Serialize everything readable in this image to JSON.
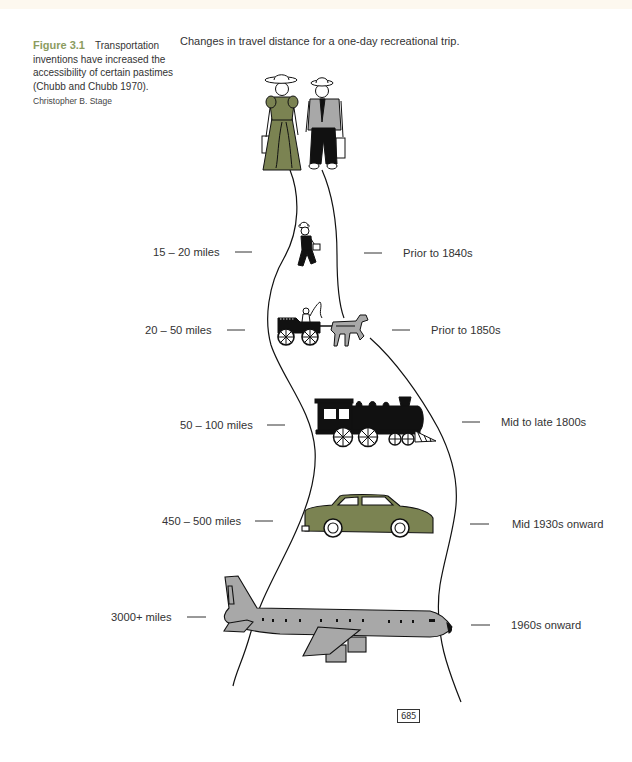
{
  "caption": {
    "figure_label": "Figure 3.1",
    "text_lines": [
      "Transportation",
      "inventions have increased the",
      "accessibility of certain pastimes",
      "(Chubb and Chubb 1970)."
    ],
    "credit": "Christopher B. Stage"
  },
  "title": "Changes in travel distance for a one-day recreational trip.",
  "stages": [
    {
      "mode_icon": "walker-icon",
      "distance": "15 – 20 miles",
      "period": "Prior to 1840s"
    },
    {
      "mode_icon": "horse-carriage-icon",
      "distance": "20 – 50 miles",
      "period": "Prior to 1850s"
    },
    {
      "mode_icon": "steam-train-icon",
      "distance": "50 – 100 miles",
      "period": "Mid to late 1800s"
    },
    {
      "mode_icon": "car-icon",
      "distance": "450 – 500 miles",
      "period": "Mid 1930s onward"
    },
    {
      "mode_icon": "airplane-icon",
      "distance": "3000+ miles",
      "period": "1960s onward"
    }
  ],
  "travelers_icon": "couple-with-suitcases-icon",
  "stamp": "685",
  "colors": {
    "figure_label": "#8c9c5e",
    "olive": "#7b8352",
    "grey": "#a8a8a8",
    "ink": "#111111"
  }
}
